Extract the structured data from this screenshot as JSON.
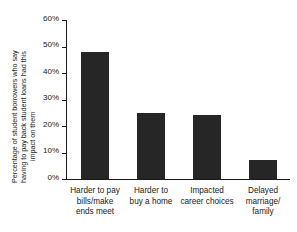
{
  "chart_data": {
    "type": "bar",
    "title": "",
    "xlabel": "",
    "ylabel": "Percentage of student borrowers who say having to pay back student loans had this impact on them",
    "ylabel_lines": [
      "Percentage of student borrowers who say",
      "having to pay back student loans had this",
      "impact on them"
    ],
    "categories": [
      "Harder to pay bills/make ends meet",
      "Harder to buy a home",
      "Impacted career choices",
      "Delayed marriage/family"
    ],
    "category_lines": [
      [
        "Harder to pay",
        "bills/make",
        "ends meet"
      ],
      [
        "Harder to",
        "buy a home"
      ],
      [
        "Impacted",
        "career choices"
      ],
      [
        "Delayed",
        "marriage/",
        "family"
      ]
    ],
    "values": [
      48,
      25,
      24,
      7
    ],
    "ylim": [
      0,
      60
    ],
    "ytick_values": [
      0,
      10,
      20,
      30,
      40,
      50,
      60
    ],
    "ytick_labels": [
      "0%",
      "10%",
      "20%",
      "30%",
      "40%",
      "50%",
      "60%"
    ],
    "grid": false,
    "legend": false,
    "bar_color": "#262626",
    "axis_color": "#1a1a1a",
    "background_color": "#ffffff"
  }
}
